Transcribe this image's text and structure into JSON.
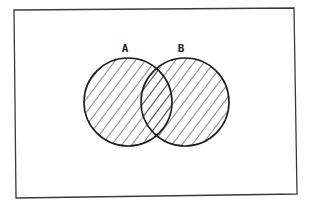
{
  "diagram": {
    "type": "venn",
    "universe": {
      "x1": 14,
      "y1": 9,
      "x2": 296,
      "y2": 196,
      "stroke": "#3a3a3a"
    },
    "sets": [
      {
        "label": "A",
        "cx": 128,
        "cy": 102,
        "r": 44,
        "label_x": 125,
        "label_y": 52
      },
      {
        "label": "B",
        "cx": 185,
        "cy": 102,
        "r": 44,
        "label_x": 181,
        "label_y": 52
      }
    ],
    "hatching": {
      "direction": "diagonal-down-right",
      "spacing": 8,
      "color": "#2a2a2a",
      "region": "A union B"
    },
    "colors": {
      "background": "#ffffff",
      "stroke": "#1e1e1e"
    }
  }
}
